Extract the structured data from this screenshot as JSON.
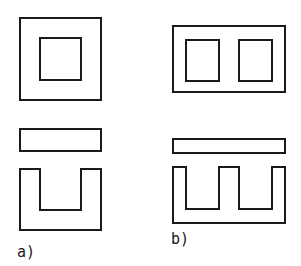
{
  "diagram": {
    "figures": [
      {
        "label": "a)",
        "assembled": "square frame with single window",
        "parts": [
          "I-bar",
          "U-core"
        ]
      },
      {
        "label": "b)",
        "assembled": "rectangular frame with two windows",
        "parts": [
          "I-bar",
          "E-core"
        ]
      }
    ],
    "colors": {
      "line": "#1a1a1a",
      "background": "#ffffff"
    }
  }
}
